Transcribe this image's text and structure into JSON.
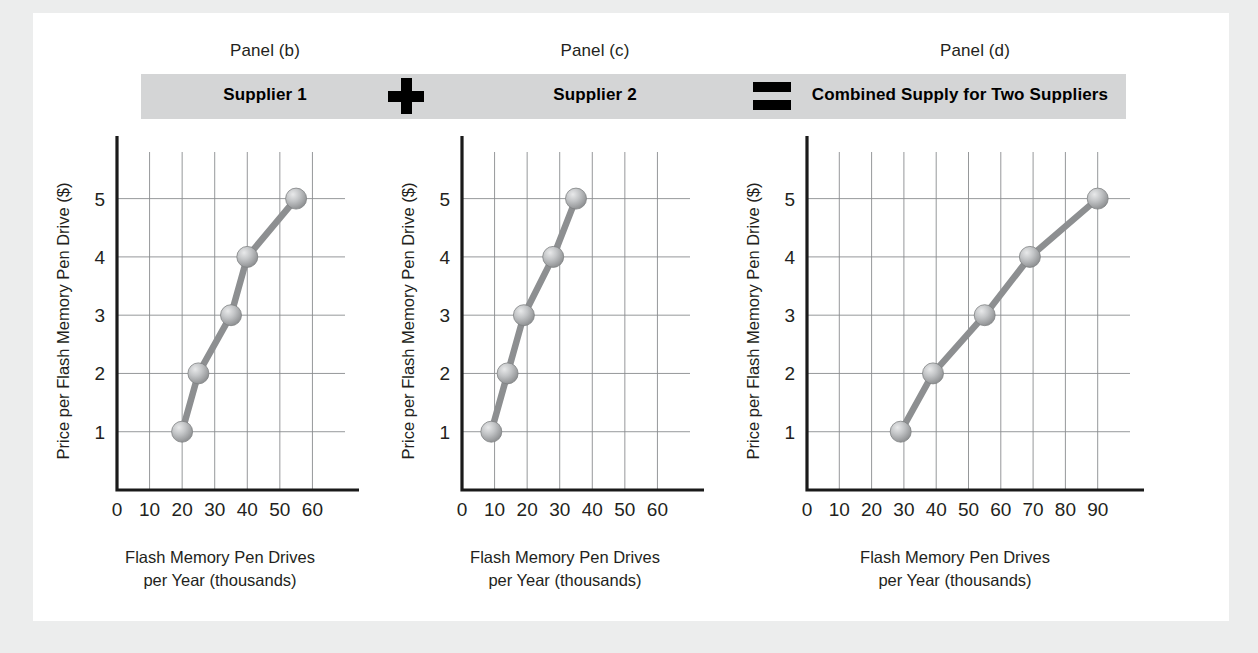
{
  "figure": {
    "background_color": "#eceded",
    "canvas_color": "#ffffff",
    "band_color": "#d4d5d6",
    "marker_color": "#b6b8ba",
    "line_color": "#8d8f91"
  },
  "captions": {
    "panel_b": "Panel (b)",
    "panel_c": "Panel (c)",
    "panel_d": "Panel (d)"
  },
  "band": {
    "supplier1": "Supplier 1",
    "supplier2": "Supplier 2",
    "combined": "Combined Supply for Two Suppliers",
    "plus_symbol": "+",
    "equals_symbol": "="
  },
  "axis_titles": {
    "y": "Price per Flash Memory Pen Drive ($)",
    "x_line1": "Flash Memory Pen Drives",
    "x_line2": "per Year (thousands)"
  },
  "chart_data": [
    {
      "type": "line",
      "title": "Supplier 1",
      "panel": "Panel (b)",
      "xlabel": "Flash Memory Pen Drives per Year (thousands)",
      "ylabel": "Price per Flash Memory Pen Drive ($)",
      "x": [
        20,
        25,
        35,
        40,
        55
      ],
      "values": [
        1,
        2,
        3,
        4,
        5
      ],
      "xlim": [
        0,
        70
      ],
      "ylim": [
        0,
        5.8
      ],
      "xticks": [
        0,
        10,
        20,
        30,
        40,
        50,
        60
      ],
      "yticks": [
        1,
        2,
        3,
        4,
        5
      ],
      "grid": true,
      "legend": "none",
      "markers": "circle"
    },
    {
      "type": "line",
      "title": "Supplier 2",
      "panel": "Panel (c)",
      "xlabel": "Flash Memory Pen Drives per Year (thousands)",
      "ylabel": "Price per Flash Memory Pen Drive ($)",
      "x": [
        9,
        14,
        19,
        28,
        35
      ],
      "values": [
        1,
        2,
        3,
        4,
        5
      ],
      "xlim": [
        0,
        70
      ],
      "ylim": [
        0,
        5.8
      ],
      "xticks": [
        0,
        10,
        20,
        30,
        40,
        50,
        60
      ],
      "yticks": [
        1,
        2,
        3,
        4,
        5
      ],
      "grid": true,
      "legend": "none",
      "markers": "circle"
    },
    {
      "type": "line",
      "title": "Combined Supply for Two Suppliers",
      "panel": "Panel (d)",
      "xlabel": "Flash Memory Pen Drives per Year (thousands)",
      "ylabel": "Price per Flash Memory Pen Drive ($)",
      "x": [
        29,
        39,
        55,
        69,
        90
      ],
      "values": [
        1,
        2,
        3,
        4,
        5
      ],
      "xlim": [
        0,
        100
      ],
      "ylim": [
        0,
        5.8
      ],
      "xticks": [
        0,
        10,
        20,
        30,
        40,
        50,
        60,
        70,
        80,
        90
      ],
      "yticks": [
        1,
        2,
        3,
        4,
        5
      ],
      "grid": true,
      "legend": "none",
      "markers": "circle"
    }
  ]
}
